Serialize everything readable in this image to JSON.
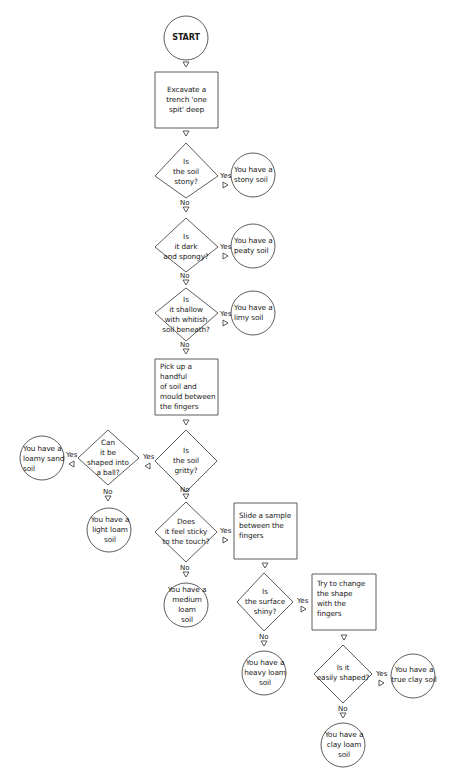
{
  "diagram": {
    "type": "flowchart",
    "colors": {
      "stroke": "#333333",
      "text": "#1a1a1a",
      "background": "#ffffff"
    },
    "labels": {
      "yes": "Yes",
      "no": "No"
    },
    "nodes": {
      "start": "START",
      "excavate": "Excavate a\ntrench 'one\nspit' deep",
      "q_stony": "Is\nthe soil\nstony?",
      "r_stony": "You have a\nstony soil",
      "q_peaty": "Is\nit dark\nand spongy?",
      "r_peaty": "You have a\npeaty soil",
      "q_limy": "Is\nit shallow\nwith whitish\nsoil beneath?",
      "r_limy": "You have a\nlimy soil",
      "pickup": "Pick up a handful\nof soil and\nmould between\nthe fingers",
      "q_gritty": "Is\nthe soil\ngritty?",
      "q_ball": "Can\nit be\nshaped into\na ball?",
      "r_loamy_sand": "You have a\nloamy sand\nsoil",
      "r_light_loam": "You have a\nlight loam\nsoil",
      "q_sticky": "Does\nit feel sticky\nto the touch?",
      "r_medium_loam": "You have a\nmedium\nloam\nsoil",
      "slide": "Slide a sample\nbetween the\nfingers",
      "q_shiny": "Is\nthe surface\nshiny?",
      "r_heavy_loam": "You have a\nheavy loam\nsoil",
      "try_change": "Try to change\nthe shape\nwith the\nfingers",
      "q_easily": "Is it\neasily shaped?",
      "r_true_clay": "You have a\ntrue clay soil",
      "r_clay_loam": "You have a\nclay loam soil"
    },
    "edges": [
      {
        "from": "start",
        "to": "excavate",
        "label": ""
      },
      {
        "from": "excavate",
        "to": "q_stony",
        "label": ""
      },
      {
        "from": "q_stony",
        "to": "r_stony",
        "label": "Yes"
      },
      {
        "from": "q_stony",
        "to": "q_peaty",
        "label": "No"
      },
      {
        "from": "q_peaty",
        "to": "r_peaty",
        "label": "Yes"
      },
      {
        "from": "q_peaty",
        "to": "q_limy",
        "label": "No"
      },
      {
        "from": "q_limy",
        "to": "r_limy",
        "label": "Yes"
      },
      {
        "from": "q_limy",
        "to": "pickup",
        "label": "No"
      },
      {
        "from": "pickup",
        "to": "q_gritty",
        "label": ""
      },
      {
        "from": "q_gritty",
        "to": "q_ball",
        "label": "Yes"
      },
      {
        "from": "q_gritty",
        "to": "q_sticky",
        "label": "No"
      },
      {
        "from": "q_ball",
        "to": "r_loamy_sand",
        "label": "Yes"
      },
      {
        "from": "q_ball",
        "to": "r_light_loam",
        "label": "No"
      },
      {
        "from": "q_sticky",
        "to": "slide",
        "label": "Yes"
      },
      {
        "from": "q_sticky",
        "to": "r_medium_loam",
        "label": "No"
      },
      {
        "from": "slide",
        "to": "q_shiny",
        "label": ""
      },
      {
        "from": "q_shiny",
        "to": "try_change",
        "label": "Yes"
      },
      {
        "from": "q_shiny",
        "to": "r_heavy_loam",
        "label": "No"
      },
      {
        "from": "try_change",
        "to": "q_easily",
        "label": ""
      },
      {
        "from": "q_easily",
        "to": "r_true_clay",
        "label": "Yes"
      },
      {
        "from": "q_easily",
        "to": "r_clay_loam",
        "label": "No"
      }
    ]
  }
}
